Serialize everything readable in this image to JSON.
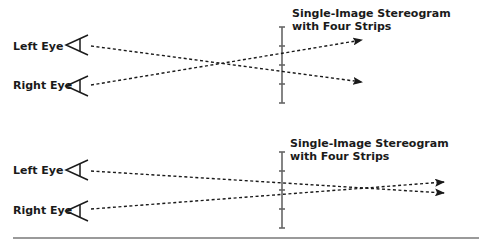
{
  "colors": {
    "ink": "#1a1a1a",
    "strip": "#666666",
    "rule": "#9a9a9a"
  },
  "panels": [
    {
      "name": "top",
      "left_eye_label": "Left Eye",
      "right_eye_label": "Right Eye",
      "title_line1": "Single-Image Stereogram",
      "title_line2": "with Four Strips",
      "strips": 4,
      "rays": "crossing"
    },
    {
      "name": "bottom",
      "left_eye_label": "Left Eye",
      "right_eye_label": "Right Eye",
      "title_line1": "Single-Image Stereogram",
      "title_line2": "with Four Strips",
      "strips": 4,
      "rays": "converging-beyond"
    }
  ]
}
